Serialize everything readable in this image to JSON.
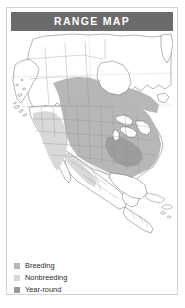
{
  "card": {
    "header": {
      "title": "RANGE MAP"
    }
  },
  "map": {
    "region_name": "North America",
    "colors": {
      "breeding": "#b4b4b4",
      "nonbreeding": "#d8d8d8",
      "year_round": "#9a9a9a",
      "land": "#ffffff",
      "water": "#ffffff",
      "coastline": "#5a5a5a",
      "internal_border": "#8d8d8d",
      "header_bar": "#6b6b6b",
      "card_border": "#d2d2d2"
    },
    "features": [
      "Alaska",
      "Aleutian Islands",
      "Canada",
      "Hudson Bay",
      "Great Lakes",
      "United States",
      "Mexico",
      "Central America",
      "Caribbean",
      "Baja California",
      "Florida",
      "Gulf of Mexico"
    ]
  },
  "legend": {
    "items": [
      {
        "label": "Breeding",
        "color": "#b4b4b4"
      },
      {
        "label": "Nonbreeding",
        "color": "#d8d8d8"
      },
      {
        "label": "Year-round",
        "color": "#9a9a9a"
      }
    ]
  }
}
